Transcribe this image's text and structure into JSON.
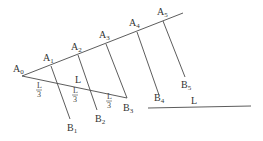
{
  "diagram": {
    "points": {
      "A0": {
        "label": "A",
        "sub": "0",
        "x": 22,
        "y": 76
      },
      "A1": {
        "label": "A",
        "sub": "1",
        "x": 51,
        "y": 66
      },
      "A2": {
        "label": "A",
        "sub": "2",
        "x": 78,
        "y": 55
      },
      "A3": {
        "label": "A",
        "sub": "3",
        "x": 106,
        "y": 44
      },
      "A4": {
        "label": "A",
        "sub": "4",
        "x": 137,
        "y": 32
      },
      "A5": {
        "label": "A",
        "sub": "5",
        "x": 163,
        "y": 21
      },
      "B1": {
        "label": "B",
        "sub": "1",
        "x": 70,
        "y": 119
      },
      "B2": {
        "label": "B",
        "sub": "2",
        "x": 97,
        "y": 110
      },
      "B3": {
        "label": "B",
        "sub": "3",
        "x": 127,
        "y": 98
      },
      "B4": {
        "label": "B",
        "sub": "4",
        "x": 159,
        "y": 95
      },
      "B5": {
        "label": "B",
        "sub": "5",
        "x": 185,
        "y": 77
      }
    },
    "segment_label": "L",
    "fraction_numerator": "L",
    "fraction_denominator": "3",
    "standalone_segment_label": "L"
  }
}
